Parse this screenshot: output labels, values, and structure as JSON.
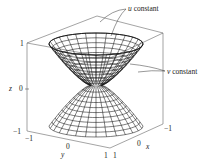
{
  "figure": {
    "type": "3d-parametric-surface",
    "annotations": {
      "u_constant": "u constant",
      "v_constant": "v constant"
    },
    "axes": {
      "z": {
        "label": "z",
        "ticks": [
          "1",
          "0",
          "−1"
        ]
      },
      "y": {
        "label": "y",
        "ticks": [
          "−1",
          "0",
          "1"
        ]
      },
      "x": {
        "label": "x",
        "ticks": [
          "1",
          "0",
          "−1"
        ]
      }
    },
    "colors": {
      "line": "#111111",
      "box": "#555555",
      "background": "#ffffff"
    }
  }
}
